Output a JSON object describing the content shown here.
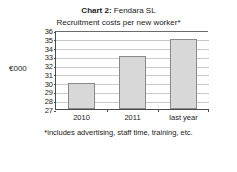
{
  "figure": {
    "title_prefix": "Chart 2",
    "title_separator": ":",
    "title_company": "Fendara SL",
    "subtitle": "Recruitment costs per new worker*",
    "y_axis_label": "€000",
    "footnote": "*includes advertising, staff time, training, etc.",
    "bar_fill_color": "#d8d8d8",
    "bar_border_color": "#8a8a8a",
    "gridline_color": "#c9c9c9",
    "axis_color": "#4a4a4a"
  },
  "chart_data": {
    "type": "bar",
    "subtitle": "Recruitment costs per new worker*",
    "categories": [
      "2010",
      "2011",
      "last year"
    ],
    "values": [
      30,
      33,
      35
    ],
    "xlabel": "",
    "ylabel": "€000",
    "ylim": [
      27,
      36
    ],
    "ytick_step": 1,
    "yticks": [
      27,
      28,
      29,
      30,
      31,
      32,
      33,
      34,
      35,
      36
    ],
    "ytick_labels": [
      "27",
      "28",
      "29",
      "30",
      "31",
      "32",
      "33",
      "34",
      "35",
      "36"
    ],
    "grid": true,
    "grid_axis": "y",
    "legend": false,
    "annotations": [
      "*includes advertising, staff time, training, etc."
    ]
  }
}
